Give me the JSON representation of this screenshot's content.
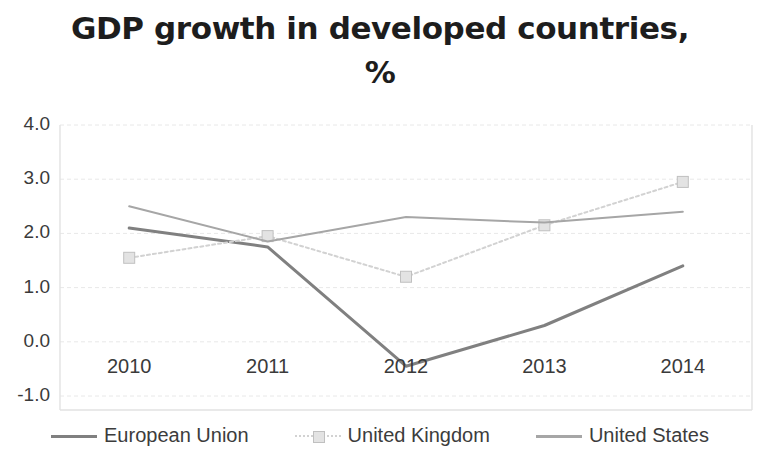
{
  "chart_data": {
    "type": "line",
    "title": "GDP growth in developed countries,\n%",
    "title_line1": "GDP growth in developed countries,",
    "title_line2": "%",
    "xlabel": "",
    "ylabel": "",
    "categories": [
      "2010",
      "2011",
      "2012",
      "2013",
      "2014"
    ],
    "x": [
      2010,
      2011,
      2012,
      2013,
      2014
    ],
    "ylim": [
      -1.0,
      4.0
    ],
    "yticks": [
      "4.0",
      "3.0",
      "2.0",
      "1.0",
      "0.0",
      "-1.0"
    ],
    "ytick_values": [
      4.0,
      3.0,
      2.0,
      1.0,
      0.0,
      -1.0
    ],
    "grid": true,
    "grid_axis": "y",
    "legend_position": "bottom",
    "series": [
      {
        "name": "European Union",
        "values": [
          2.1,
          1.75,
          -0.45,
          0.3,
          1.4
        ],
        "color": "#808080",
        "style": "solid",
        "marker": "none",
        "width": 3
      },
      {
        "name": "United Kingdom",
        "values": [
          1.55,
          1.95,
          1.2,
          2.15,
          2.95
        ],
        "color": "#d2d2d2",
        "marker_color": "#e3e3e3",
        "marker_edge": "#c0c0c0",
        "style": "dotted",
        "marker": "square",
        "width": 2
      },
      {
        "name": "United States",
        "values": [
          2.5,
          1.85,
          2.3,
          2.2,
          2.4
        ],
        "color": "#a6a6a6",
        "style": "solid",
        "marker": "none",
        "width": 2
      }
    ]
  },
  "axes": {
    "plot_border_color": "#e2e2e2",
    "gridline_color": "#e8e8e8",
    "background": "#ffffff"
  },
  "legend": {
    "items": [
      {
        "label": "European Union"
      },
      {
        "label": "United Kingdom"
      },
      {
        "label": "United States"
      }
    ]
  }
}
